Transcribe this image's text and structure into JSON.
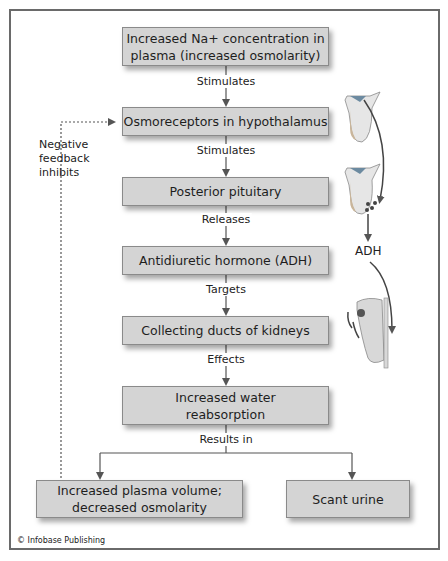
{
  "diagram": {
    "boxes": [
      {
        "id": "na-concentration",
        "line1": "Increased Na+ concentration in",
        "line2": "plasma (increased osmolarity)"
      },
      {
        "id": "osmoreceptors",
        "text": "Osmoreceptors in hypothalamus"
      },
      {
        "id": "posterior-pituitary",
        "text": "Posterior pituitary"
      },
      {
        "id": "adh",
        "text": "Antidiuretic hormone (ADH)"
      },
      {
        "id": "collecting-ducts",
        "text": "Collecting ducts of kidneys"
      },
      {
        "id": "water-reabsorption",
        "line1": "Increased water",
        "line2": "reabsorption"
      },
      {
        "id": "plasma-volume",
        "line1": "Increased plasma volume;",
        "line2": "decreased osmolarity"
      },
      {
        "id": "scant-urine",
        "text": "Scant urine"
      }
    ],
    "connector_labels": [
      "Stimulates",
      "Stimulates",
      "Releases",
      "Targets",
      "Effects",
      "Results in"
    ],
    "feedback_label": {
      "line1": "Negative",
      "line2": "feedback",
      "line3": "inhibits"
    },
    "illustration_label": "ADH",
    "credit": "© Infobase Publishing",
    "colors": {
      "box_fill": "#d4d4d4",
      "box_border": "#8a8a8a",
      "line": "#555555",
      "frame": "#6a6a6a"
    }
  }
}
